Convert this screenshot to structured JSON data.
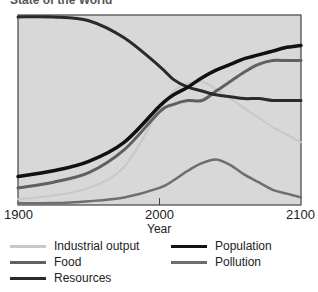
{
  "chart_data": {
    "type": "line",
    "title": "State of the World",
    "xlabel": "Year",
    "ylabel": "",
    "xlim": [
      1900,
      2100
    ],
    "ylim": [
      0,
      100
    ],
    "x_ticks": [
      "1900",
      "2000",
      "2100"
    ],
    "grid": false,
    "legend_position": "bottom",
    "x": [
      1900,
      1925,
      1950,
      1975,
      2000,
      2010,
      2020,
      2030,
      2040,
      2050,
      2060,
      2070,
      2080,
      2090,
      2100
    ],
    "series": [
      {
        "name": "Industrial output",
        "color": "#c8c8c8",
        "values": [
          3,
          5,
          9,
          20,
          50,
          60,
          64,
          65,
          61,
          56,
          51,
          46,
          41,
          37,
          33
        ]
      },
      {
        "name": "Food",
        "color": "#606060",
        "values": [
          9,
          12,
          17,
          29,
          49,
          53,
          55,
          55,
          60,
          65,
          70,
          74,
          76,
          76,
          76
        ]
      },
      {
        "name": "Resources",
        "color": "#2a2a2a",
        "values": [
          99,
          99,
          97,
          88,
          73,
          66,
          62,
          60,
          58,
          57,
          56,
          56,
          55,
          55,
          55
        ]
      },
      {
        "name": "Population",
        "color": "#111111",
        "values": [
          15,
          18,
          23,
          33,
          52,
          58,
          62,
          67,
          71,
          74,
          77,
          79,
          81,
          83,
          84
        ]
      },
      {
        "name": "Pollution",
        "color": "#6e6e6e",
        "values": [
          1,
          1,
          2,
          4,
          9,
          13,
          18,
          22,
          24,
          21,
          16,
          12,
          8,
          6,
          4
        ]
      }
    ]
  },
  "axis": {
    "ticks": [
      "1900",
      "2000",
      "2100"
    ],
    "xlabel": "Year"
  },
  "legend": [
    {
      "label": "Industrial output",
      "color": "#c8c8c8"
    },
    {
      "label": "Food",
      "color": "#606060"
    },
    {
      "label": "Resources",
      "color": "#2a2a2a"
    },
    {
      "label": "Population",
      "color": "#111111"
    },
    {
      "label": "Pollution",
      "color": "#6e6e6e"
    }
  ],
  "title": "State of the World"
}
